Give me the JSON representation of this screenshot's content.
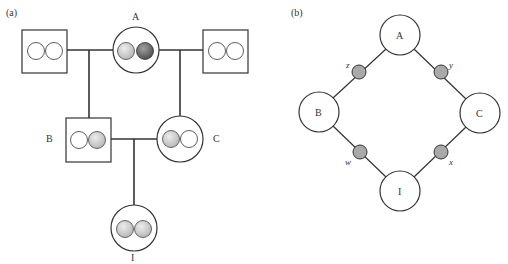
{
  "panel_a": {
    "label": "(a)",
    "individuals": {
      "A": {
        "label": "A",
        "sex": "female",
        "alleles": [
          "light",
          "dark"
        ]
      },
      "left_father": {
        "label": "",
        "sex": "male",
        "alleles": [
          "empty",
          "empty"
        ]
      },
      "right_father": {
        "label": "",
        "sex": "male",
        "alleles": [
          "empty",
          "empty"
        ]
      },
      "B": {
        "label": "B",
        "sex": "male",
        "alleles": [
          "empty",
          "light"
        ]
      },
      "C": {
        "label": "C",
        "sex": "female",
        "alleles": [
          "light",
          "empty"
        ]
      },
      "I": {
        "label": "I",
        "sex": "female",
        "alleles": [
          "light",
          "light"
        ]
      }
    }
  },
  "panel_b": {
    "label": "(b)",
    "nodes": {
      "A": "A",
      "B": "B",
      "C": "C",
      "I": "I"
    },
    "edge_nodes": {
      "z": "z",
      "y": "y",
      "w": "w",
      "x": "x"
    }
  },
  "colors": {
    "line": "#333333",
    "light_allele": "#c8c8c8",
    "dark_allele": "#6e6e6e",
    "edge_node": "#a9a9a9"
  }
}
